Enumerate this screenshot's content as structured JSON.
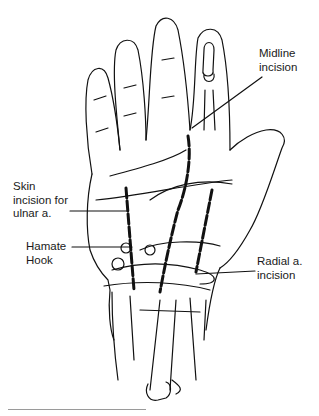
{
  "figure": {
    "labels": {
      "midline": {
        "line1": "Midline",
        "line2": "incision"
      },
      "ulnar": {
        "line1": "Skin",
        "line2": "incision for",
        "line3": "ulnar a."
      },
      "hamate": {
        "line1": "Hamate",
        "line2": "Hook"
      },
      "radial": {
        "line1": "Radial a.",
        "line2": "incision"
      }
    },
    "colors": {
      "ink": "#111111",
      "background": "#ffffff",
      "rule": "#9a9a9a"
    }
  }
}
